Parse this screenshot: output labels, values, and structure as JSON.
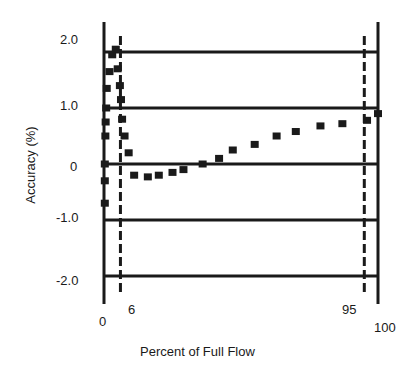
{
  "chart_data": {
    "type": "scatter",
    "title": "",
    "xlabel": "Percent of Full Flow",
    "ylabel": "Accuracy (%)",
    "ytick_labels": [
      "2.0",
      "1.0",
      "0",
      "-1.0",
      "-2.0"
    ],
    "xtick_labels": [
      "0",
      "6",
      "95",
      "100"
    ],
    "xlim": [
      0,
      100
    ],
    "ylim": [
      -2.5,
      2.5
    ],
    "reference_lines": [
      {
        "x": 6,
        "style": "dashed"
      },
      {
        "x": 95,
        "style": "dashed"
      }
    ],
    "grid": "horizontal",
    "series": [
      {
        "name": "Accuracy",
        "marker": "square",
        "points": [
          [
            0.3,
            -0.7
          ],
          [
            0.3,
            -0.3
          ],
          [
            0.3,
            0.0
          ],
          [
            0.5,
            0.5
          ],
          [
            0.6,
            0.75
          ],
          [
            0.8,
            1.0
          ],
          [
            1.0,
            1.35
          ],
          [
            2.0,
            1.65
          ],
          [
            3.0,
            1.95
          ],
          [
            4.3,
            2.05
          ],
          [
            5.0,
            1.7
          ],
          [
            5.8,
            1.4
          ],
          [
            6.2,
            1.15
          ],
          [
            6.6,
            0.8
          ],
          [
            7.5,
            0.5
          ],
          [
            9.0,
            0.2
          ],
          [
            11,
            -0.2
          ],
          [
            16,
            -0.23
          ],
          [
            20,
            -0.2
          ],
          [
            25,
            -0.15
          ],
          [
            29,
            -0.1
          ],
          [
            36,
            0.0
          ],
          [
            42,
            0.1
          ],
          [
            47,
            0.25
          ],
          [
            55,
            0.35
          ],
          [
            63,
            0.5
          ],
          [
            70,
            0.58
          ],
          [
            79,
            0.68
          ],
          [
            87,
            0.72
          ],
          [
            96,
            0.78
          ],
          [
            100,
            0.9
          ]
        ]
      }
    ]
  }
}
